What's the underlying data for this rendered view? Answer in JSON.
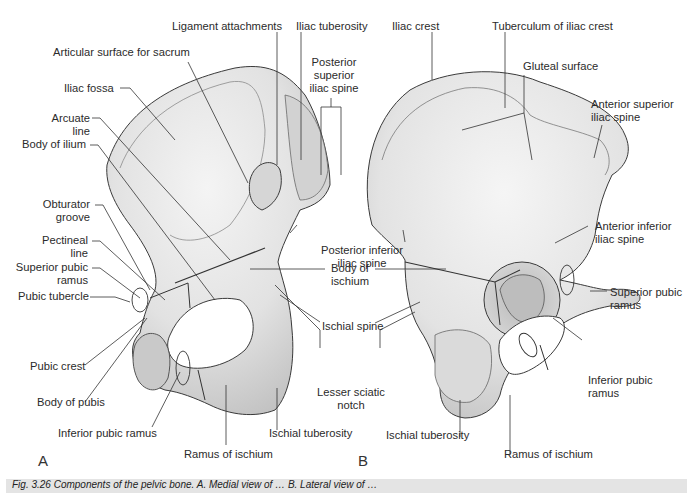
{
  "figure": {
    "panel_a": {
      "letter": "A",
      "labels": {
        "ligament_attachments": "Ligament attachments",
        "iliac_tuberosity": "Iliac tuberosity",
        "articular_surface": "Articular surface for sacrum",
        "posterior_superior_iliac_spine_1": "Posterior",
        "posterior_superior_iliac_spine_2": "superior",
        "posterior_superior_iliac_spine_3": "iliac spine",
        "iliac_fossa": "Iliac fossa",
        "arcuate_line_1": "Arcuate",
        "arcuate_line_2": "line",
        "body_of_ilium": "Body of ilium",
        "obturator_groove_1": "Obturator",
        "obturator_groove_2": "groove",
        "pectineal_line_1": "Pectineal",
        "pectineal_line_2": "line",
        "superior_pubic_ramus_1": "Superior pubic",
        "superior_pubic_ramus_2": "ramus",
        "pubic_tubercle": "Pubic tubercle",
        "pubic_crest": "Pubic crest",
        "body_of_pubis": "Body of pubis",
        "inferior_pubic_ramus": "Inferior pubic ramus",
        "ramus_of_ischium": "Ramus of ischium",
        "ischial_tuberosity": "Ischial tuberosity"
      }
    },
    "shared": {
      "posterior_inferior_iliac_spine_1": "Posterior inferior",
      "posterior_inferior_iliac_spine_2": "iliac spine",
      "body_of_ischium_1": "Body of",
      "body_of_ischium_2": "ischium",
      "ischial_spine": "Ischial spine",
      "lesser_sciatic_notch_1": "Lesser sciatic",
      "lesser_sciatic_notch_2": "notch"
    },
    "panel_b": {
      "letter": "B",
      "labels": {
        "iliac_crest": "Iliac crest",
        "tuberculum": "Tuberculum of iliac crest",
        "gluteal_surface": "Gluteal surface",
        "asis_1": "Anterior superior",
        "asis_2": "iliac spine",
        "aiis_1": "Anterior inferior",
        "aiis_2": "iliac spine",
        "superior_pubic_ramus_1": "Superior pubic",
        "superior_pubic_ramus_2": "ramus",
        "inferior_pubic_ramus_1": "Inferior pubic",
        "inferior_pubic_ramus_2": "ramus",
        "ischial_tuberosity": "Ischial tuberosity",
        "ramus_of_ischium": "Ramus of ischium"
      }
    },
    "caption": "Fig. 3.26 Components of the pelvic bone. A. Medial view of … B. Lateral view of …",
    "colors": {
      "bone_fill": "#e9e9e9",
      "bone_shade": "#cfcfcf",
      "outline": "#3a3a3a",
      "leader": "#333333",
      "caption_bg": "#e4e4e4"
    }
  }
}
